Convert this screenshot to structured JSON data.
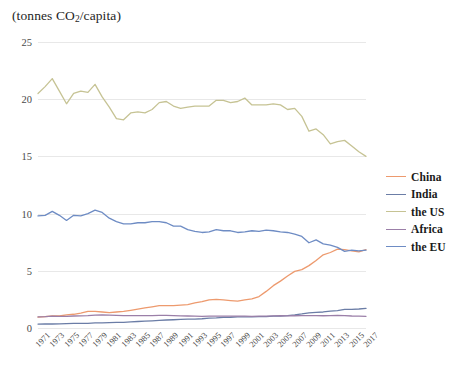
{
  "chart_data": {
    "type": "line",
    "title": "(tonnes CO2/capita)",
    "title_prefix": "(tonnes CO",
    "title_sub": "2",
    "title_suffix": "/capita)",
    "xlabel": "",
    "ylabel": "",
    "ylim": [
      0,
      25
    ],
    "yticks": [
      0,
      5,
      10,
      15,
      20,
      25
    ],
    "ytick_labels": [
      "0",
      "5",
      "10",
      "15",
      "20",
      "25"
    ],
    "grid": true,
    "legend_position": "right",
    "xlim": [
      1971,
      2017
    ],
    "x": [
      1971,
      1972,
      1973,
      1974,
      1975,
      1976,
      1977,
      1978,
      1979,
      1980,
      1981,
      1982,
      1983,
      1984,
      1985,
      1986,
      1987,
      1988,
      1989,
      1990,
      1991,
      1992,
      1993,
      1994,
      1995,
      1996,
      1997,
      1998,
      1999,
      2000,
      2001,
      2002,
      2003,
      2004,
      2005,
      2006,
      2007,
      2008,
      2009,
      2010,
      2011,
      2012,
      2013,
      2014,
      2015,
      2016,
      2017
    ],
    "xtick_labels": [
      "1971",
      "1973",
      "1975",
      "1977",
      "1979",
      "1981",
      "1983",
      "1985",
      "1987",
      "1989",
      "1991",
      "1993",
      "1995",
      "1997",
      "1999",
      "2001",
      "2003",
      "2005",
      "2007",
      "2009",
      "2011",
      "2013",
      "2015",
      "2017"
    ],
    "series": [
      {
        "name": "China",
        "color": "#ED9A6E",
        "values": [
          0.95,
          1.0,
          1.05,
          1.05,
          1.15,
          1.2,
          1.3,
          1.45,
          1.45,
          1.4,
          1.35,
          1.4,
          1.45,
          1.55,
          1.65,
          1.75,
          1.85,
          1.95,
          1.95,
          1.95,
          2.0,
          2.05,
          2.2,
          2.3,
          2.45,
          2.5,
          2.45,
          2.4,
          2.35,
          2.45,
          2.55,
          2.75,
          3.2,
          3.7,
          4.1,
          4.55,
          4.95,
          5.1,
          5.45,
          5.9,
          6.4,
          6.6,
          6.9,
          6.85,
          6.75,
          6.65,
          6.85
        ]
      },
      {
        "name": "India",
        "color": "#6B7DA6",
        "values": [
          0.34,
          0.35,
          0.35,
          0.36,
          0.38,
          0.4,
          0.41,
          0.41,
          0.44,
          0.44,
          0.47,
          0.49,
          0.5,
          0.53,
          0.57,
          0.6,
          0.63,
          0.66,
          0.7,
          0.72,
          0.75,
          0.77,
          0.78,
          0.81,
          0.87,
          0.89,
          0.93,
          0.94,
          0.97,
          0.98,
          0.98,
          1.0,
          1.0,
          1.03,
          1.05,
          1.09,
          1.15,
          1.23,
          1.33,
          1.36,
          1.4,
          1.48,
          1.52,
          1.62,
          1.63,
          1.66,
          1.71
        ]
      },
      {
        "name": "the US",
        "color": "#C6C394",
        "values": [
          20.5,
          21.1,
          21.8,
          20.7,
          19.6,
          20.5,
          20.7,
          20.6,
          21.3,
          20.2,
          19.3,
          18.3,
          18.2,
          18.8,
          18.9,
          18.8,
          19.1,
          19.7,
          19.8,
          19.4,
          19.2,
          19.3,
          19.4,
          19.4,
          19.4,
          19.9,
          19.9,
          19.7,
          19.8,
          20.1,
          19.5,
          19.5,
          19.5,
          19.6,
          19.5,
          19.1,
          19.2,
          18.5,
          17.2,
          17.4,
          16.9,
          16.1,
          16.3,
          16.4,
          15.9,
          15.4,
          15.0
        ]
      },
      {
        "name": "Africa",
        "color": "#9B7FA8",
        "values": [
          0.98,
          1.0,
          1.04,
          1.02,
          1.02,
          1.05,
          1.06,
          1.08,
          1.12,
          1.14,
          1.13,
          1.11,
          1.08,
          1.08,
          1.08,
          1.09,
          1.09,
          1.1,
          1.1,
          1.09,
          1.06,
          1.05,
          1.03,
          1.02,
          1.04,
          1.03,
          1.04,
          1.04,
          1.03,
          1.03,
          1.02,
          1.03,
          1.04,
          1.06,
          1.07,
          1.06,
          1.07,
          1.08,
          1.08,
          1.08,
          1.07,
          1.09,
          1.1,
          1.09,
          1.05,
          1.03,
          1.02
        ]
      },
      {
        "name": "the EU",
        "color": "#6E8CC4",
        "values": [
          9.8,
          9.85,
          10.2,
          9.85,
          9.4,
          9.85,
          9.8,
          10.0,
          10.3,
          10.1,
          9.6,
          9.3,
          9.1,
          9.1,
          9.2,
          9.2,
          9.3,
          9.3,
          9.2,
          8.9,
          8.9,
          8.6,
          8.45,
          8.35,
          8.4,
          8.6,
          8.5,
          8.5,
          8.35,
          8.4,
          8.5,
          8.45,
          8.55,
          8.5,
          8.4,
          8.35,
          8.2,
          8.0,
          7.45,
          7.7,
          7.35,
          7.25,
          7.05,
          6.7,
          6.8,
          6.75,
          6.8
        ]
      }
    ]
  },
  "legend": {
    "items": [
      {
        "label": "China"
      },
      {
        "label": "India"
      },
      {
        "label": "the US"
      },
      {
        "label": "Africa"
      },
      {
        "label": "the EU"
      }
    ]
  }
}
